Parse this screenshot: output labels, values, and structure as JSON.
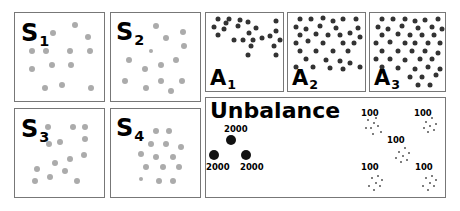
{
  "panels": {
    "s1": {
      "letter": "S",
      "sub": "1"
    },
    "s2": {
      "letter": "S",
      "sub": "2"
    },
    "s3": {
      "letter": "S",
      "sub": "3"
    },
    "s4": {
      "letter": "S",
      "sub": "4"
    },
    "a1": {
      "letter": "A",
      "sub": "1"
    },
    "a2": {
      "letter": "A",
      "sub": "2"
    },
    "a3": {
      "letter": "A",
      "sub": "3"
    },
    "unbalance": {
      "title": "Unbalance",
      "dense_counts": [
        "2000",
        "2000",
        "2000"
      ],
      "sparse_counts": [
        "100",
        "100",
        "100",
        "100",
        "100"
      ]
    }
  }
}
